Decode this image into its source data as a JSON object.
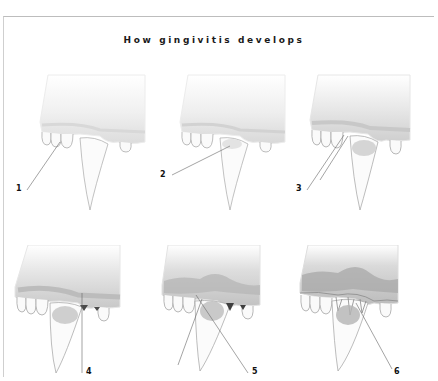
{
  "title": "How gingivitis develops",
  "stages": [
    {
      "number": "1",
      "gum_shade": "#e6e6e6",
      "inflammation": 0
    },
    {
      "number": "2",
      "gum_shade": "#e2e2e2",
      "inflammation": 1
    },
    {
      "number": "3",
      "gum_shade": "#d9d9d9",
      "inflammation": 2
    },
    {
      "number": "4",
      "gum_shade": "#d0d0d0",
      "inflammation": 3
    },
    {
      "number": "5",
      "gum_shade": "#c4c4c4",
      "inflammation": 4
    },
    {
      "number": "6",
      "gum_shade": "#b8b8b8",
      "inflammation": 5
    }
  ],
  "colors": {
    "frame": "#c8c8c8",
    "title": "#1a1a1a",
    "tooth_outline": "#9a9a9a",
    "leader_line": "#555555",
    "dark_plaque": "#4a4a4a"
  }
}
